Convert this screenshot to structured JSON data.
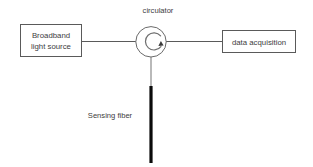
{
  "diagram": {
    "background_color": "#ffffff",
    "line_color": "#5a5a5a",
    "fiber_color": "#0b0b0b",
    "text_color": "#3d3d3d",
    "nodes": {
      "source_box": {
        "label_line_1": "Broadband",
        "label_line_2": "light source",
        "shape": "rectangle"
      },
      "circulator": {
        "label": "circulator",
        "shape": "circle",
        "arrow_direction": "clockwise"
      },
      "daq_box": {
        "label": "data acquisition",
        "shape": "rectangle"
      },
      "sensing_fiber": {
        "label": "Sensing fiber",
        "shape": "thick-vertical-line"
      }
    },
    "connections": [
      {
        "from": "source_box",
        "to": "circulator",
        "orientation": "horizontal"
      },
      {
        "from": "circulator",
        "to": "daq_box",
        "orientation": "horizontal"
      },
      {
        "from": "circulator",
        "to": "sensing_fiber",
        "orientation": "vertical"
      }
    ]
  }
}
